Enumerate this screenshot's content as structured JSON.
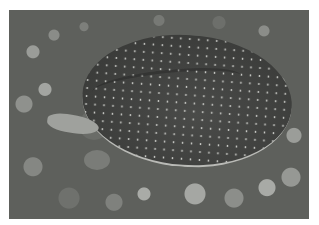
{
  "image": {
    "subject": "softshell turtle on gravel",
    "style": "grayscale photograph",
    "border_color": "#ffffff",
    "colors": {
      "shell": "#3e3f3d",
      "spots": "#c8c9c5",
      "gravel": "#5e605c"
    }
  }
}
